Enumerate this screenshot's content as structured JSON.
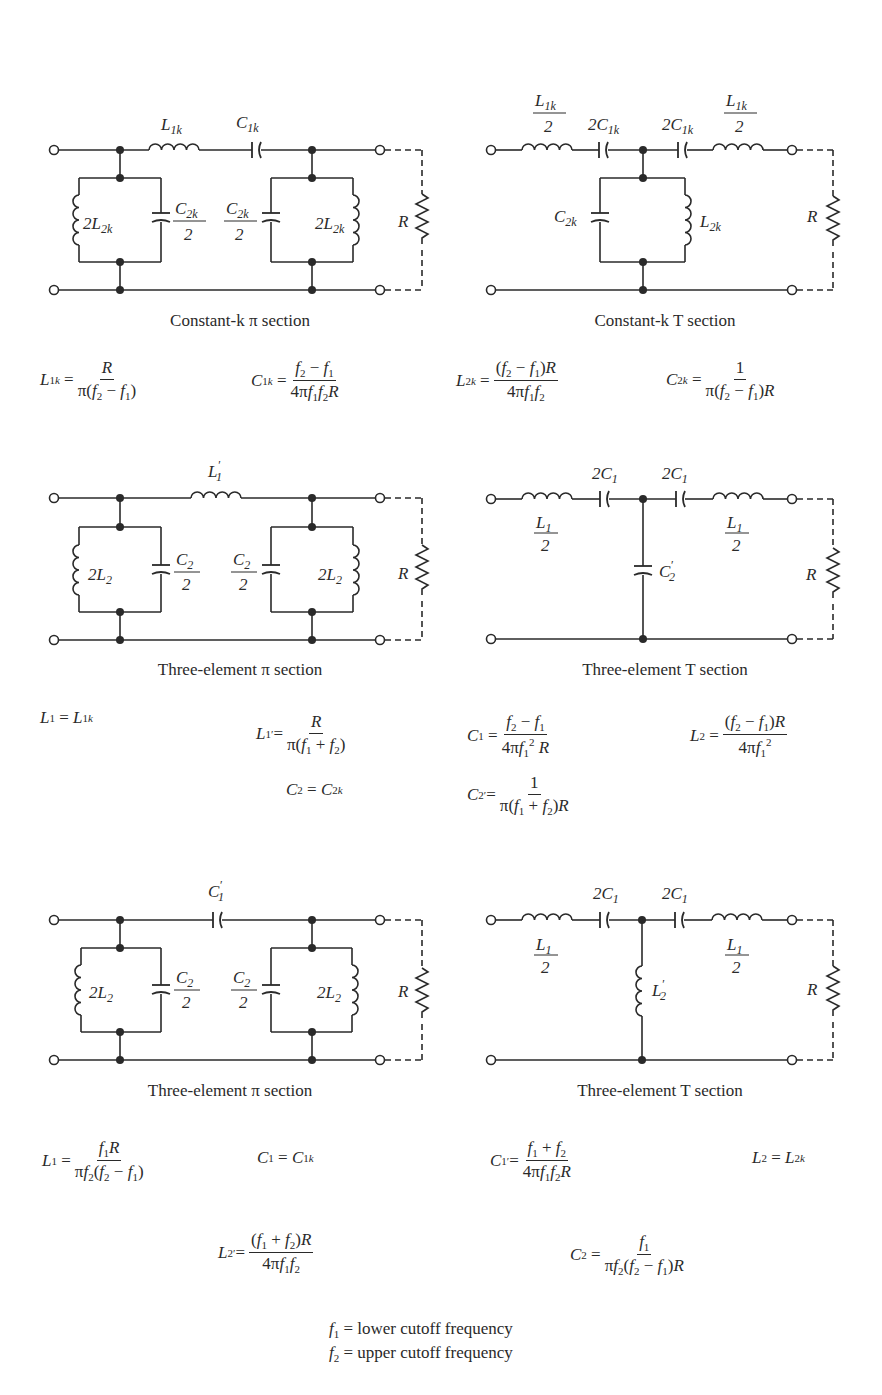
{
  "figure": {
    "sections": [
      {
        "id": "constant-k-pi",
        "caption": "Constant-k π section",
        "components": [
          "L1k",
          "C1k",
          "2L2k",
          "C2k/2",
          "C2k/2",
          "2L2k",
          "R"
        ]
      },
      {
        "id": "constant-k-t",
        "caption": "Constant-k T section",
        "components": [
          "L1k/2",
          "2C1k",
          "2C1k",
          "L1k/2",
          "C2k",
          "L2k",
          "R"
        ]
      },
      {
        "id": "three-element-pi-a",
        "caption": "Three-element π section",
        "components": [
          "L1'",
          "2L2",
          "C2/2",
          "C2/2",
          "2L2",
          "R"
        ]
      },
      {
        "id": "three-element-t-a",
        "caption": "Three-element T section",
        "components": [
          "L1/2",
          "2C1",
          "2C1",
          "L1/2",
          "C2'",
          "R"
        ]
      },
      {
        "id": "three-element-pi-b",
        "caption": "Three-element π section",
        "components": [
          "C1'",
          "2L2",
          "C2/2",
          "C2/2",
          "2L2",
          "R"
        ]
      },
      {
        "id": "three-element-t-b",
        "caption": "Three-element T section",
        "components": [
          "L1/2",
          "2C1",
          "2C1",
          "L1/2",
          "L2'",
          "R"
        ]
      }
    ],
    "captions": {
      "c1": "Constant-k π section",
      "c2": "Constant-k T section",
      "c3": "Three-element π section",
      "c4": "Three-element T section",
      "c5": "Three-element π section",
      "c6": "Three-element T section"
    },
    "equations": {
      "group1": [
        "L1k = R / π(f2 − f1)",
        "C1k = (f2 − f1) / 4πf1f2R",
        "L2k = (f2 − f1)R / 4πf1f2",
        "C2k = 1 / π(f2 − f1)R"
      ],
      "group2": [
        "L1 = L1k",
        "L1' = R / π(f1 + f2)",
        "C1 = (f2 − f1) / 4πf1²R",
        "L2 = (f2 − f1)R / 4πf1²",
        "C2 = C2k",
        "C2' = 1 / π(f1 + f2)R"
      ],
      "group3": [
        "L1 = f1R / πf2(f2 − f1)",
        "C1 = C1k",
        "C1' = (f1 + f2) / 4πf1f2R",
        "L2 = L2k",
        "L2' = (f1 + f2)R / 4πf1f2",
        "C2 = f1 / πf2(f2 − f1)R"
      ]
    },
    "legend": {
      "f1": "= lower cutoff frequency",
      "f2": "= upper cutoff frequency"
    }
  }
}
